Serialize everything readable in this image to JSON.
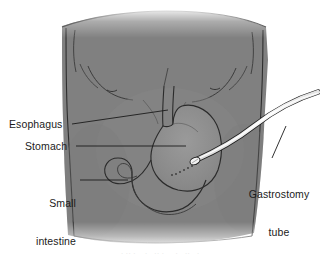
{
  "figure": {
    "kind": "medical-illustration",
    "background_color": "#ffffff",
    "body_fill_color": "#808080",
    "organ_fill_color": "#8d8d8d",
    "outline_color": "#2b2b2b",
    "tube_color": "#fbfbfb",
    "label_color": "#1b1b1b"
  },
  "labels": {
    "esophagus": "Esophagus",
    "stomach": "Stomach",
    "small_intestine_line1": "Small",
    "small_intestine_line2": "intestine",
    "gastrostomy_tube_line1": "Gastrostomy",
    "gastrostomy_tube_line2": "tube"
  },
  "caption": {
    "cropped_text": "· ·· ·    ·   ·· ·     ·   ··   ·"
  }
}
